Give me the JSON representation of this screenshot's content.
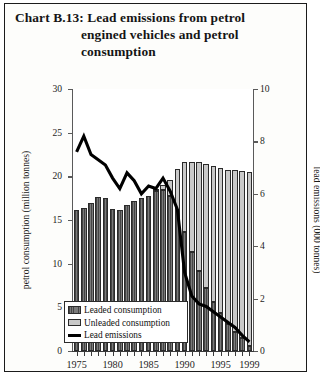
{
  "title": {
    "line1": "Chart B.13:  Lead emissions from petrol",
    "line2": "engined vehicles and petrol",
    "line3": "consumption"
  },
  "legend": {
    "items": [
      {
        "label": "Leaded consumption",
        "marker": "dark-hatched-swatch",
        "color": "#7a7a7a"
      },
      {
        "label": "Unleaded consumption",
        "marker": "light-gray-swatch",
        "color": "#c9c9c9"
      },
      {
        "label": "Lead emissions",
        "marker": "black-line",
        "color": "#000000"
      }
    ]
  },
  "chart_data": {
    "type": "bar",
    "title": "Chart B.13: Lead emissions from petrol engined vehicles and petrol consumption",
    "xlabel": "",
    "ylabel": "petrol consumption (million tonnes)",
    "y2label": "lead emissions (000 tonnes)",
    "ylim": [
      0,
      30
    ],
    "y2lim": [
      0,
      10
    ],
    "yticks": [
      0,
      5,
      10,
      15,
      20,
      25,
      30
    ],
    "y2ticks": [
      0,
      2,
      4,
      6,
      8,
      10
    ],
    "xticks": [
      "1975",
      "1980",
      "1985",
      "1990",
      "1995",
      "1999"
    ],
    "grid": false,
    "legend_position": "lower-left-inside",
    "stacked": true,
    "categories": [
      "1975",
      "1976",
      "1977",
      "1978",
      "1979",
      "1980",
      "1981",
      "1982",
      "1983",
      "1984",
      "1985",
      "1986",
      "1987",
      "1988",
      "1989",
      "1990",
      "1991",
      "1992",
      "1993",
      "1994",
      "1995",
      "1996",
      "1997",
      "1998",
      "1999"
    ],
    "series": [
      {
        "name": "Leaded consumption",
        "axis": "left",
        "units": "million tonnes",
        "values": [
          16.2,
          16.4,
          17.0,
          17.6,
          17.5,
          16.3,
          16.2,
          16.7,
          17.2,
          17.5,
          17.8,
          18.3,
          18.4,
          17.8,
          16.1,
          13.6,
          11.3,
          9.2,
          7.2,
          5.6,
          4.3,
          3.1,
          2.2,
          1.5,
          0.6
        ]
      },
      {
        "name": "Unleaded consumption",
        "axis": "left",
        "units": "million tonnes",
        "values": [
          0.0,
          0.0,
          0.0,
          0.0,
          0.0,
          0.0,
          0.0,
          0.0,
          0.0,
          0.0,
          0.0,
          0.2,
          0.6,
          1.8,
          4.8,
          8.0,
          10.3,
          12.4,
          14.2,
          15.6,
          16.6,
          17.6,
          18.5,
          19.1,
          19.9
        ]
      },
      {
        "name": "Lead emissions",
        "axis": "right",
        "units": "000 tonnes",
        "type": "line",
        "values": [
          7.6,
          8.2,
          7.5,
          7.3,
          7.1,
          6.6,
          6.2,
          6.8,
          6.5,
          6.0,
          6.3,
          6.2,
          6.6,
          6.1,
          5.4,
          3.0,
          2.1,
          1.8,
          1.7,
          1.5,
          1.3,
          1.1,
          0.9,
          0.6,
          0.35
        ]
      }
    ]
  }
}
